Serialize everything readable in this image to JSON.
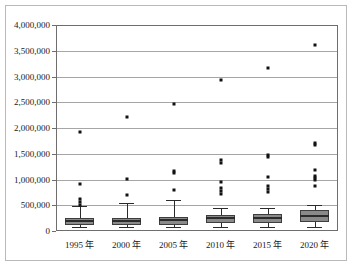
{
  "chart_data": {
    "type": "box",
    "title": "",
    "xlabel": "",
    "ylabel": "",
    "categories": [
      "1995 年",
      "2000 年",
      "2005 年",
      "2010 年",
      "2015 年",
      "2020 年"
    ],
    "ylim": [
      0,
      4000000
    ],
    "ytick_values": [
      0,
      500000,
      1000000,
      1500000,
      2000000,
      2500000,
      3000000,
      3500000,
      4000000
    ],
    "ytick_labels": [
      "0",
      "500,000",
      "1,000,000",
      "1,500,000",
      "2,000,000",
      "2,500,000",
      "3,000,000",
      "3,500,000",
      "4,000,000"
    ],
    "grid": true,
    "grid_axis": "y",
    "legend": false,
    "colors": {
      "box_fill": "#8a8a8a",
      "box_edge": "#3d3d3d",
      "median": "#2b2b2b",
      "whisker": "#2b2b2b",
      "outlier": "#111111",
      "gridline": "#a6a6a6",
      "plot_border": "#6e6e6e",
      "frame_border": "#b9b9b9",
      "background": "#ffffff"
    },
    "boxes": [
      {
        "category": "1995 年",
        "whisker_low": 70000,
        "q1": 110000,
        "median": 185000,
        "q3": 250000,
        "whisker_high": 480000,
        "outliers": [
          510000,
          560000,
          625000,
          915000,
          1920000
        ]
      },
      {
        "category": "2000 年",
        "whisker_low": 70000,
        "q1": 115000,
        "median": 190000,
        "q3": 255000,
        "whisker_high": 545000,
        "outliers": [
          700000,
          1010000,
          2215000
        ]
      },
      {
        "category": "2005 年",
        "whisker_low": 75000,
        "q1": 125000,
        "median": 215000,
        "q3": 270000,
        "whisker_high": 600000,
        "outliers": [
          800000,
          1120000,
          1165000,
          2460000
        ]
      },
      {
        "category": "2010 年",
        "whisker_low": 75000,
        "q1": 150000,
        "median": 245000,
        "q3": 320000,
        "whisker_high": 440000,
        "outliers": [
          720000,
          770000,
          830000,
          950000,
          1330000,
          1370000,
          2930000
        ]
      },
      {
        "category": "2015 年",
        "whisker_low": 80000,
        "q1": 155000,
        "median": 250000,
        "q3": 330000,
        "whisker_high": 455000,
        "outliers": [
          760000,
          810000,
          870000,
          1040000,
          1440000,
          1480000,
          3160000
        ]
      },
      {
        "category": "2020 年",
        "whisker_low": 80000,
        "q1": 175000,
        "median": 295000,
        "q3": 410000,
        "whisker_high": 510000,
        "outliers": [
          880000,
          990000,
          1030000,
          1070000,
          1180000,
          1670000,
          1715000,
          3610000
        ]
      }
    ]
  }
}
